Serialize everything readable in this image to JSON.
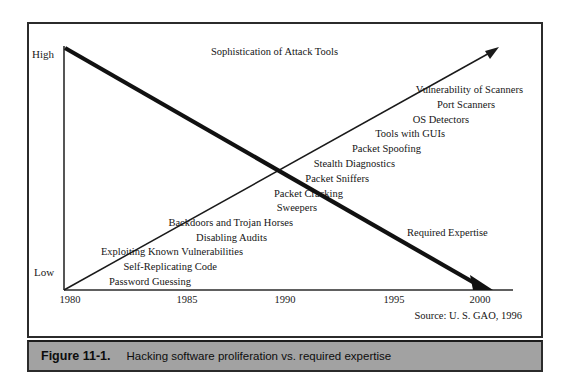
{
  "figure": {
    "caption_number": "Figure 11-1.",
    "caption_text": "Hacking software proliferation vs. required expertise",
    "source_note": "Source: U. S. GAO, 1996"
  },
  "axes": {
    "y_high_label": "High",
    "y_low_label": "Low",
    "x_ticks": [
      "1980",
      "1985",
      "1990",
      "1995",
      "2000"
    ]
  },
  "trends": {
    "ascending_label": "Sophistication of Attack Tools",
    "descending_label": "Required Expertise"
  },
  "chart_data": {
    "type": "line",
    "title": "Hacking software proliferation vs. required expertise",
    "xlabel": "",
    "ylabel": "",
    "xlim": [
      1980,
      2001
    ],
    "ylim": [
      0,
      1
    ],
    "y_tick_labels": [
      "Low",
      "High"
    ],
    "x_tick_labels": [
      "1980",
      "1985",
      "1990",
      "1995",
      "2000"
    ],
    "grid": false,
    "legend": "inline-annotations",
    "series": [
      {
        "name": "Sophistication of Attack Tools",
        "trend": "increasing",
        "x": [
          1980,
          2001
        ],
        "values": [
          0.0,
          1.0
        ]
      },
      {
        "name": "Required Expertise",
        "trend": "decreasing",
        "x": [
          1980,
          2000
        ],
        "values": [
          1.0,
          0.0
        ]
      }
    ],
    "annotations": [
      {
        "label": "Password Guessing",
        "x": 1980.6,
        "y": 0.02
      },
      {
        "label": "Self-Replicating Code",
        "x": 1982.0,
        "y": 0.09
      },
      {
        "label": "Exploiting Known Vulnerabilities",
        "x": 1983.4,
        "y": 0.16
      },
      {
        "label": "Disabling Audits",
        "x": 1984.6,
        "y": 0.23
      },
      {
        "label": "Backdoors and Trojan Horses",
        "x": 1986.0,
        "y": 0.3
      },
      {
        "label": "Sweepers",
        "x": 1987.2,
        "y": 0.37
      },
      {
        "label": "Packet Cracking",
        "x": 1988.5,
        "y": 0.44
      },
      {
        "label": "Packet Sniffers",
        "x": 1989.8,
        "y": 0.51
      },
      {
        "label": "Stealth Diagnostics",
        "x": 1991.1,
        "y": 0.58
      },
      {
        "label": "Packet Spoofing",
        "x": 1992.4,
        "y": 0.65
      },
      {
        "label": "Tools with GUIs",
        "x": 1993.7,
        "y": 0.72
      },
      {
        "label": "OS Detectors",
        "x": 1995.0,
        "y": 0.79
      },
      {
        "label": "Port Scanners",
        "x": 1996.3,
        "y": 0.86
      },
      {
        "label": "Vulnerability of Scanners",
        "x": 1997.6,
        "y": 0.93
      }
    ]
  },
  "tool_labels": [
    {
      "text": "Vulnerability of Scanners",
      "left": 494,
      "top": 60
    },
    {
      "text": "Port Scanners",
      "left": 466,
      "top": 75
    },
    {
      "text": "OS Detectors",
      "left": 440,
      "top": 90
    },
    {
      "text": "Tools with GUIs",
      "left": 416,
      "top": 104
    },
    {
      "text": "Packet Spoofing",
      "left": 392,
      "top": 119
    },
    {
      "text": "Stealth Diagnostics",
      "left": 366,
      "top": 134
    },
    {
      "text": "Packet Sniffers",
      "left": 340,
      "top": 149
    },
    {
      "text": "Packet Cracking",
      "left": 314,
      "top": 164
    },
    {
      "text": "Sweepers",
      "left": 288,
      "top": 178
    },
    {
      "text": "Backdoors and Trojan Horses",
      "left": 264,
      "top": 193
    },
    {
      "text": "Disabling Audits",
      "left": 238,
      "top": 208
    },
    {
      "text": "Exploiting Known Vulnerabilities",
      "left": 214,
      "top": 222
    },
    {
      "text": "Self-Replicating Code",
      "left": 188,
      "top": 237
    },
    {
      "text": "Password Guessing",
      "left": 162,
      "top": 252
    }
  ],
  "tick_positions": [
    41,
    158,
    256,
    365,
    451
  ]
}
